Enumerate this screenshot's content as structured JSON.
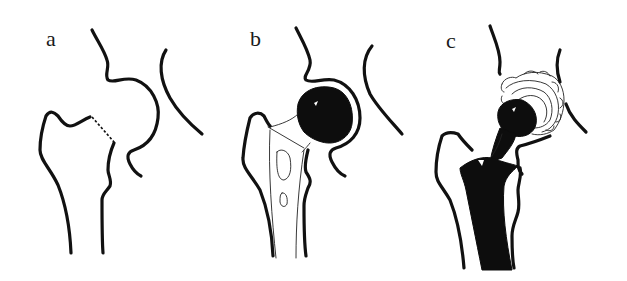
{
  "figure": {
    "colors": {
      "ink": "#111111",
      "background": "#ffffff"
    },
    "panels": [
      {
        "id": "a",
        "label": "a",
        "content": "Native proximal femur and acetabulum with dashed osteotomy line across femoral neck"
      },
      {
        "id": "b",
        "label": "b",
        "content": "Femoral stem with prosthetic head articulating in native acetabulum (hemiarthroplasty)"
      },
      {
        "id": "c",
        "label": "c",
        "content": "Total hip replacement: cemented femoral stem, prosthetic head and acetabular cup"
      }
    ]
  }
}
